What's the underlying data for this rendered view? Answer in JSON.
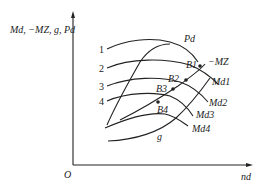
{
  "axes": {
    "y_label": "Md, −MZ, g, Pd",
    "x_label": "nd",
    "origin": "O"
  },
  "curve_numbers": [
    "1",
    "2",
    "3",
    "4"
  ],
  "curve_labels": {
    "Pd": "Pd",
    "MZ": "−MZ",
    "Md1": "Md1",
    "Md2": "Md2",
    "Md3": "Md3",
    "Md4": "Md4",
    "g": "g"
  },
  "points": [
    "B1",
    "B2",
    "B3",
    "B4"
  ]
}
